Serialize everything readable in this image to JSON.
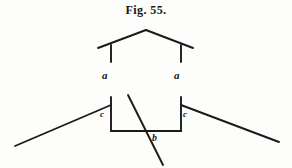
{
  "figure": {
    "caption": "Fig. 55.",
    "background_color": "#fdfdfb",
    "ink_color": "#1a1a1a",
    "labels": {
      "roof_plate_left": "a",
      "roof_plate_right": "a",
      "sill_left": "c",
      "sill_right": "c",
      "footing_center": "b"
    }
  },
  "chart_data": {
    "type": "diagram",
    "title": "Fig. 55.",
    "xlabel": "",
    "ylabel": "",
    "xlim": [
      0,
      292
    ],
    "ylim": [
      0,
      168
    ],
    "grid": false,
    "legend": "none",
    "annotations": [
      {
        "text": "a",
        "x": 106,
        "y": 77,
        "style": "italic"
      },
      {
        "text": "a",
        "x": 178,
        "y": 77,
        "style": "italic"
      },
      {
        "text": "c",
        "x": 104,
        "y": 116,
        "style": "italic"
      },
      {
        "text": "c",
        "x": 185,
        "y": 116,
        "style": "italic"
      },
      {
        "text": "b",
        "x": 155,
        "y": 139,
        "style": "italic"
      }
    ],
    "series": [
      {
        "name": "roof-left-rafter",
        "type": "line",
        "points": [
          [
            98,
            48
          ],
          [
            146,
            30
          ]
        ]
      },
      {
        "name": "roof-right-rafter",
        "type": "line",
        "points": [
          [
            146,
            30
          ],
          [
            193,
            48
          ]
        ]
      },
      {
        "name": "post-left",
        "type": "line",
        "points": [
          [
            111,
            45
          ],
          [
            111,
            62
          ]
        ]
      },
      {
        "name": "post-right",
        "type": "line",
        "points": [
          [
            181,
            45
          ],
          [
            181,
            62
          ]
        ]
      },
      {
        "name": "wall-left",
        "type": "line",
        "points": [
          [
            111,
            97
          ],
          [
            111,
            131
          ]
        ]
      },
      {
        "name": "wall-right",
        "type": "line",
        "points": [
          [
            181,
            97
          ],
          [
            181,
            131
          ]
        ]
      },
      {
        "name": "footing-bottom",
        "type": "line",
        "points": [
          [
            111,
            131
          ],
          [
            181,
            131
          ]
        ]
      },
      {
        "name": "ground-left",
        "type": "line",
        "points": [
          [
            15,
            146
          ],
          [
            111,
            105
          ]
        ]
      },
      {
        "name": "ground-right",
        "type": "line",
        "points": [
          [
            181,
            105
          ],
          [
            279,
            142
          ]
        ]
      },
      {
        "name": "diagonal-brace",
        "type": "line",
        "points": [
          [
            128,
            95
          ],
          [
            163,
            165
          ]
        ]
      }
    ]
  }
}
